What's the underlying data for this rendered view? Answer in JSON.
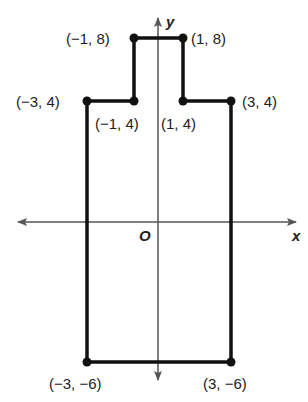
{
  "figure": {
    "type": "coordinate-plane polygon",
    "axes": {
      "x_label": "x",
      "y_label": "y",
      "origin_label": "O"
    },
    "vertices": [
      {
        "label": "(−1, 8)",
        "x": -1,
        "y": 8
      },
      {
        "label": "(1, 8)",
        "x": 1,
        "y": 8
      },
      {
        "label": "(1, 4)",
        "x": 1,
        "y": 4
      },
      {
        "label": "(3, 4)",
        "x": 3,
        "y": 4
      },
      {
        "label": "(3, −6)",
        "x": 3,
        "y": -6
      },
      {
        "label": "(−3, −6)",
        "x": -3,
        "y": -6
      },
      {
        "label": "(−3, 4)",
        "x": -3,
        "y": 4
      },
      {
        "label": "(−1, 4)",
        "x": -1,
        "y": 4
      }
    ],
    "colors": {
      "polygon": "#111111",
      "axes": "#555555",
      "text": "#222222"
    }
  }
}
